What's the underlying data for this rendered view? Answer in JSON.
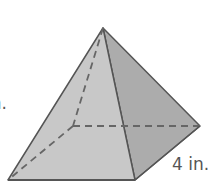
{
  "figure": {
    "type": "square-pyramid",
    "labels": {
      "left": "in.",
      "right": "4 in."
    },
    "colors": {
      "front_face": "#c8c8c8",
      "right_face": "#acacac",
      "edge": "#555555",
      "hidden_edge": "#666666"
    }
  }
}
